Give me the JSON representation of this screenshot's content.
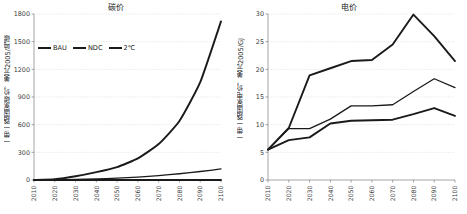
{
  "chart_data": [
    {
      "type": "line",
      "panel": "left",
      "title": "碳价",
      "xlabel": "",
      "ylabel": "一带一路国家碳价，美元2005/吨碳",
      "x": [
        2010,
        2020,
        2030,
        2040,
        2050,
        2060,
        2070,
        2080,
        2090,
        2100
      ],
      "xlim": [
        2010,
        2100
      ],
      "ylim": [
        0,
        1800
      ],
      "yticks": [
        0,
        300,
        600,
        900,
        1200,
        1500,
        1800
      ],
      "xticks": [
        "2010",
        "2020",
        "2030",
        "2040",
        "2050",
        "2060",
        "2070",
        "2080",
        "2090",
        "2100"
      ],
      "grid": true,
      "legend_position": "upper-left-inside",
      "series": [
        {
          "name": "BAU",
          "values": [
            0,
            0,
            0,
            0,
            0,
            0,
            0,
            0,
            0,
            0
          ]
        },
        {
          "name": "NDC",
          "values": [
            0,
            2,
            6,
            12,
            20,
            32,
            48,
            68,
            92,
            120
          ]
        },
        {
          "name": "2℃",
          "values": [
            0,
            8,
            40,
            85,
            140,
            235,
            390,
            640,
            1060,
            1720
          ]
        }
      ]
    },
    {
      "type": "line",
      "panel": "right",
      "title": "电价",
      "xlabel": "",
      "ylabel": "一带一路国家电价，美元2005/GJ",
      "x": [
        2010,
        2020,
        2030,
        2040,
        2050,
        2060,
        2070,
        2080,
        2090,
        2100
      ],
      "xlim": [
        2010,
        2100
      ],
      "ylim": [
        0,
        30
      ],
      "yticks": [
        0,
        5,
        10,
        15,
        20,
        25,
        30
      ],
      "xticks": [
        "2010",
        "2020",
        "2030",
        "2040",
        "2050",
        "2060",
        "2070",
        "2080",
        "2090",
        "2100"
      ],
      "grid": true,
      "legend_position": "none",
      "series": [
        {
          "name": "2℃",
          "values": [
            5.5,
            9.4,
            18.9,
            20.2,
            21.5,
            21.7,
            24.5,
            29.9,
            26.0,
            21.5
          ]
        },
        {
          "name": "NDC",
          "values": [
            5.5,
            9.3,
            9.3,
            11.0,
            13.4,
            13.4,
            13.6,
            16.0,
            18.3,
            16.7
          ]
        },
        {
          "name": "BAU",
          "values": [
            5.5,
            7.2,
            7.7,
            10.2,
            10.7,
            10.8,
            10.9,
            11.9,
            13.0,
            11.6
          ]
        }
      ]
    }
  ],
  "left_panel": {
    "title": "碳价",
    "ylabel": "一带一路国家碳价，美元2005/吨碳",
    "legend": [
      {
        "label": "BAU"
      },
      {
        "label": "NDC"
      },
      {
        "label": "2℃"
      }
    ]
  },
  "right_panel": {
    "title": "电价",
    "ylabel": "一带一路国家电价，美元2005/GJ"
  }
}
